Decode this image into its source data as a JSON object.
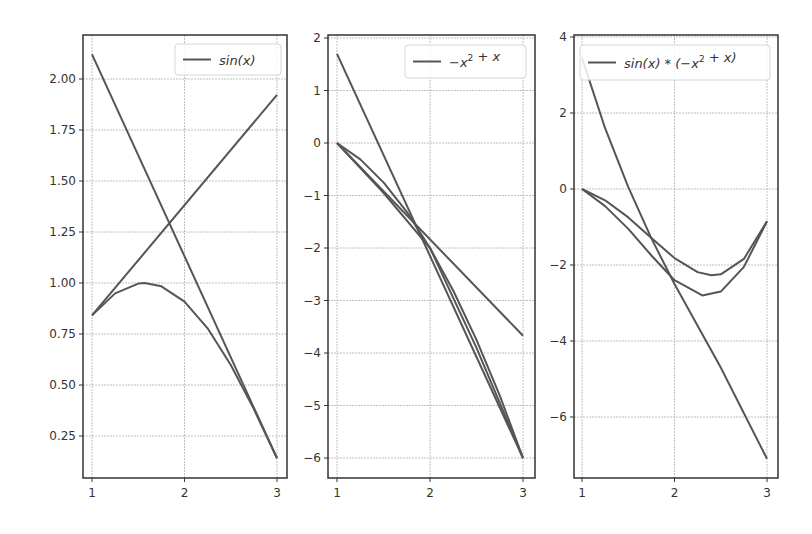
{
  "figure": {
    "width": 812,
    "height": 534,
    "line_color": "#555555",
    "grid_color": "#b0b0b0",
    "frame_color": "#333333"
  },
  "chart_data": [
    {
      "type": "line",
      "title": "",
      "legend": [
        "sin(x)"
      ],
      "legend_position": "upper right",
      "grid": true,
      "xlim": [
        0.9,
        3.1
      ],
      "ylim": [
        0.05,
        2.2
      ],
      "xticks": [
        1,
        2,
        3
      ],
      "xtick_labels": [
        "1",
        "2",
        "3"
      ],
      "yticks": [
        0.25,
        0.5,
        0.75,
        1.0,
        1.25,
        1.5,
        1.75,
        2.0
      ],
      "ytick_labels": [
        "0.25",
        "0.50",
        "0.75",
        "1.00",
        "1.25",
        "1.50",
        "1.75",
        "2.00"
      ],
      "series": [
        {
          "name": "sin(x)",
          "x": [
            1.0,
            1.25,
            1.5,
            1.57,
            1.75,
            2.0,
            2.25,
            2.5,
            2.75,
            3.0
          ],
          "y": [
            0.841,
            0.949,
            0.997,
            1.0,
            0.984,
            0.909,
            0.778,
            0.598,
            0.382,
            0.141
          ]
        },
        {
          "name": "tangent at x=1",
          "x": [
            1,
            3
          ],
          "y": [
            0.841,
            1.922
          ]
        },
        {
          "name": "tangent at x=3",
          "x": [
            1,
            3
          ],
          "y": [
            2.121,
            0.141
          ]
        }
      ],
      "frame": {
        "left": 83,
        "right": 287,
        "top": 35,
        "bottom": 478
      },
      "legend_box": {
        "x": 175,
        "y": 44,
        "w": 106,
        "h": 31
      },
      "x_px": [
        92,
        277
      ],
      "y_px_ref": {
        "v": 1.0,
        "px": 283,
        "px_per_unit": 204
      }
    },
    {
      "type": "line",
      "title": "",
      "legend": [
        "-x^2 + x"
      ],
      "legend_position": "upper right",
      "grid": true,
      "xlim": [
        0.9,
        3.1
      ],
      "ylim": [
        -6.4,
        2.1
      ],
      "xticks": [
        1,
        2,
        3
      ],
      "xtick_labels": [
        "1",
        "2",
        "3"
      ],
      "yticks": [
        -6,
        -5,
        -4,
        -3,
        -2,
        -1,
        0,
        1,
        2
      ],
      "ytick_labels": [
        "−6",
        "−5",
        "−4",
        "−3",
        "−2",
        "−1",
        "0",
        "1",
        "2"
      ],
      "series": [
        {
          "name": "-x^2 + x",
          "x": [
            1.0,
            1.25,
            1.5,
            1.75,
            2.0,
            2.25,
            2.5,
            2.75,
            3.0
          ],
          "y": [
            0.0,
            -0.3125,
            -0.75,
            -1.3125,
            -2.0,
            -2.8125,
            -3.75,
            -4.8125,
            -6.0
          ]
        },
        {
          "name": "approx curve",
          "x": [
            1.0,
            1.5,
            2.0,
            2.5,
            3.0
          ],
          "y": [
            0.0,
            -0.95,
            -2.0,
            -3.9,
            -6.0
          ]
        },
        {
          "name": "tangent line A",
          "x": [
            1,
            3
          ],
          "y": [
            1.7,
            -6.0
          ]
        },
        {
          "name": "tangent line B",
          "x": [
            1,
            3
          ],
          "y": [
            0.0,
            -3.67
          ]
        }
      ],
      "frame": {
        "left": 328,
        "right": 535,
        "top": 35,
        "bottom": 478
      },
      "legend_box": {
        "x": 405,
        "y": 45,
        "w": 121,
        "h": 33
      },
      "x_px": [
        337,
        523
      ],
      "y_px_ref": {
        "v": 0,
        "px": 143,
        "px_per_unit": 52.5
      }
    },
    {
      "type": "line",
      "title": "",
      "legend": [
        "sin(x) * (-x^2 + x)"
      ],
      "legend_position": "upper right",
      "grid": true,
      "xlim": [
        0.9,
        3.1
      ],
      "ylim": [
        -7.6,
        4.0
      ],
      "xticks": [
        1,
        2,
        3
      ],
      "xtick_labels": [
        "1",
        "2",
        "3"
      ],
      "yticks": [
        -6,
        -4,
        -2,
        0,
        2,
        4
      ],
      "ytick_labels": [
        "−6",
        "−4",
        "−2",
        "0",
        "2",
        "4"
      ],
      "series": [
        {
          "name": "sin(x) * (-x^2 + x)",
          "x": [
            1.0,
            1.25,
            1.5,
            1.75,
            2.0,
            2.25,
            2.4,
            2.5,
            2.75,
            3.0
          ],
          "y": [
            0.0,
            -0.297,
            -0.748,
            -1.292,
            -1.819,
            -2.188,
            -2.27,
            -2.244,
            -1.84,
            -0.847
          ]
        },
        {
          "name": "approx curve",
          "x": [
            1.0,
            1.25,
            1.5,
            1.75,
            2.0,
            2.3,
            2.5,
            2.75,
            3.0
          ],
          "y": [
            0.0,
            -0.45,
            -1.05,
            -1.75,
            -2.4,
            -2.8,
            -2.7,
            -2.05,
            -0.85
          ]
        },
        {
          "name": "steep curve",
          "x": [
            1.0,
            1.25,
            1.5,
            1.75,
            2.0,
            2.25,
            2.5,
            2.75,
            3.0
          ],
          "y": [
            3.45,
            1.6,
            0.05,
            -1.3,
            -2.5,
            -3.6,
            -4.7,
            -5.9,
            -7.1
          ]
        }
      ],
      "frame": {
        "left": 574,
        "right": 778,
        "top": 35,
        "bottom": 478
      },
      "legend_box": {
        "x": 580,
        "y": 45,
        "w": 190,
        "h": 35
      },
      "x_px": [
        582,
        767
      ],
      "y_px_ref": {
        "v": 0,
        "px": 189,
        "px_per_unit": 38
      }
    }
  ]
}
